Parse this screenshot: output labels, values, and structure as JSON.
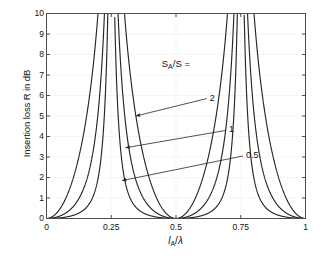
{
  "figure": {
    "background_color": "#ffffff",
    "axes_color": "#4d4d4d",
    "grid_color": "#d9d9d9",
    "curve_color": "#262626"
  },
  "chart_data": {
    "type": "line",
    "title": "",
    "xlabel": "l_A/λ",
    "xlabel_parts": {
      "main": "l",
      "sub": "A",
      "div": "/",
      "lambda": "λ"
    },
    "ylabel": "Insertion loss R in dB",
    "xlim": [
      0,
      1
    ],
    "ylim": [
      0,
      10
    ],
    "xticks": [
      0,
      0.25,
      0.5,
      0.75,
      1
    ],
    "xticklabels": [
      "0",
      "0.25",
      "0.5",
      "0.75",
      "1"
    ],
    "yticks": [
      0,
      1,
      2,
      3,
      4,
      5,
      6,
      7,
      8,
      9,
      10
    ],
    "yticklabels": [
      "0",
      "1",
      "2",
      "3",
      "4",
      "5",
      "6",
      "7",
      "8",
      "9",
      "10"
    ],
    "grid": true,
    "legend": "none",
    "annotation_title": "S_A/S =",
    "annotation_title_parts": {
      "main": "S",
      "sub": "A",
      "rest": "/S ="
    },
    "formula": "R = 10*log10(1 + (m/2 * tan(2*pi*x))^2)",
    "series": [
      {
        "name": "2",
        "m": 2,
        "label": "2",
        "label_x": 0.63,
        "label_y": 5.85,
        "arrow_tip_x": 0.345,
        "arrow_tip_y": 5.0
      },
      {
        "name": "1",
        "m": 1,
        "label": "1",
        "label_x": 0.705,
        "label_y": 4.3,
        "arrow_tip_x": 0.305,
        "arrow_tip_y": 3.45
      },
      {
        "name": "0.5",
        "m": 0.5,
        "label": "0.5",
        "label_x": 0.77,
        "label_y": 3.05,
        "arrow_tip_x": 0.292,
        "arrow_tip_y": 1.85
      }
    ],
    "asymptotes": [
      0.25,
      0.75
    ],
    "zeros": [
      0,
      0.5,
      1
    ]
  }
}
